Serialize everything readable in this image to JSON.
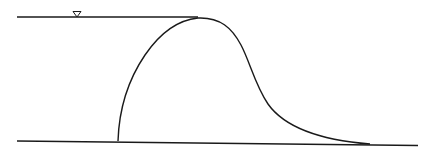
{
  "diagram": {
    "type": "hydraulic-profile",
    "stroke_color": "#1a1a1a",
    "background": "#ffffff",
    "elements": {
      "water_surface_line": {
        "x1": 17,
        "y1": 17,
        "x2": 198,
        "y2": 17
      },
      "water_level_symbol": {
        "x": 77,
        "y": 17,
        "glyph": "inverted-triangle"
      },
      "bed_line": {
        "x1": 17,
        "y1": 141,
        "x2": 418,
        "y2": 145
      },
      "profile_curve": {
        "upstream_toe": {
          "x": 118,
          "y": 141
        },
        "crest": {
          "x": 198,
          "y": 18
        },
        "downstream_toe": {
          "x": 370,
          "y": 144
        }
      }
    }
  }
}
